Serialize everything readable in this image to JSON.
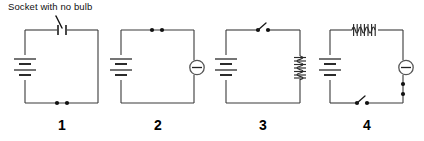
{
  "figure": {
    "annotation": {
      "text": "Socket with no bulb",
      "points_to": "circuit-1-socket"
    },
    "line_color": "#3a3a3a",
    "dot_color": "#111111",
    "background": "#ffffff"
  },
  "circuits": [
    {
      "label": "1",
      "components": [
        {
          "name": "battery",
          "side": "left",
          "cells": 2
        },
        {
          "name": "socket-no-bulb",
          "side": "top",
          "symbol": "open-gap-contacts"
        },
        {
          "name": "contact-dots",
          "side": "bottom",
          "count": 2
        }
      ]
    },
    {
      "label": "2",
      "components": [
        {
          "name": "battery",
          "side": "left",
          "cells": 2
        },
        {
          "name": "contact-dots",
          "side": "top",
          "count": 2
        },
        {
          "name": "lamp",
          "side": "right",
          "symbol": "circle-with-bar"
        }
      ]
    },
    {
      "label": "3",
      "components": [
        {
          "name": "battery",
          "side": "left",
          "cells": 2
        },
        {
          "name": "switch-open",
          "side": "top",
          "state": "open"
        },
        {
          "name": "coil-resistor",
          "side": "right",
          "orientation": "vertical"
        }
      ]
    },
    {
      "label": "4",
      "components": [
        {
          "name": "battery",
          "side": "left",
          "cells": 2
        },
        {
          "name": "coil-resistor",
          "side": "top",
          "orientation": "horizontal"
        },
        {
          "name": "lamp",
          "side": "right",
          "symbol": "circle-with-bar"
        },
        {
          "name": "contact-dots",
          "side": "right-lower",
          "count": 2
        },
        {
          "name": "switch-open",
          "side": "bottom",
          "state": "open"
        }
      ]
    }
  ]
}
